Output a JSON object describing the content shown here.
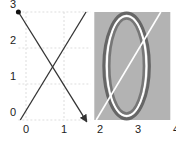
{
  "chart_data": [
    {
      "type": "line",
      "panel": "left",
      "title": "",
      "xlabel": "",
      "ylabel": "",
      "xlim": [
        -0.2,
        1.7
      ],
      "ylim": [
        0,
        3
      ],
      "grid": true,
      "xticks": [
        0,
        1
      ],
      "xtick_labels": [
        "0",
        "1"
      ],
      "yticks": [
        0,
        1,
        2,
        3
      ],
      "ytick_labels": [
        "0",
        "1",
        "2",
        "3"
      ],
      "series": [
        {
          "name": "descending-arrow",
          "points": [
            [
              -0.2,
              3.0
            ],
            [
              1.6,
              -0.05
            ]
          ],
          "start_marker": "dot",
          "end_marker": "arrow",
          "color": "#333333"
        },
        {
          "name": "ascending-line",
          "points": [
            [
              -0.15,
              0.0
            ],
            [
              1.58,
              3.0
            ]
          ],
          "start_marker": "none",
          "end_marker": "none",
          "color": "#333333"
        }
      ]
    },
    {
      "type": "scatter",
      "panel": "right",
      "title": "",
      "xlabel": "",
      "ylabel": "",
      "xlim": [
        1.85,
        3.85
      ],
      "ylim": [
        0,
        3
      ],
      "xticks": [
        2,
        3,
        4
      ],
      "xtick_labels": [
        "2",
        "3",
        "4"
      ],
      "background": "#b3b3b3",
      "shapes": [
        {
          "name": "ellipse",
          "center": [
            2.7,
            1.5
          ],
          "semi_axes": [
            0.6,
            1.47
          ],
          "outline_colors": [
            "#666666",
            "#ffffff",
            "#777777"
          ]
        },
        {
          "name": "diagonal-line",
          "points": [
            [
              1.9,
              0.0
            ],
            [
              3.6,
              3.0
            ]
          ],
          "color": "#ffffff"
        }
      ]
    }
  ]
}
